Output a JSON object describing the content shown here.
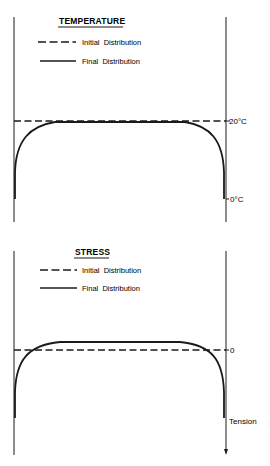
{
  "panels": [
    {
      "id": "temperature",
      "title": "TEMPERATURE",
      "legend": [
        {
          "style": "dashed",
          "label": "Initial  Distribution"
        },
        {
          "style": "solid",
          "label": "Final  Distribution"
        }
      ],
      "axis_labels": {
        "upper": "20°C",
        "lower": "0°C"
      }
    },
    {
      "id": "stress",
      "title": "STRESS",
      "legend": [
        {
          "style": "dashed",
          "label": "Initial  Distribution"
        },
        {
          "style": "solid",
          "label": "Final  Distribution"
        }
      ],
      "axis_labels": {
        "upper": "0",
        "lower": "Tension"
      }
    }
  ],
  "colors": {
    "ink": "#1a1a1a",
    "background": "#ffffff"
  }
}
